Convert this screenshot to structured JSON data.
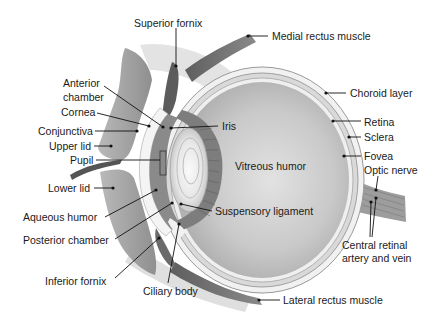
{
  "colors": {
    "background": "#ffffff",
    "text": "#1a1a1a",
    "leader": "#111111",
    "tissue_dark": "#6f6f6f",
    "tissue_mid": "#a9a9a9",
    "tissue_light": "#d6d6d6",
    "vitreous": "#c4c4c4",
    "sclera": "#eeeeee"
  },
  "labels": {
    "superior_fornix": "Superior fornix",
    "medial_rectus": "Medial rectus muscle",
    "anterior_chamber_1": "Anterior",
    "anterior_chamber_2": "chamber",
    "cornea": "Cornea",
    "conjunctiva": "Conjunctiva",
    "upper_lid": "Upper lid",
    "pupil": "Pupil",
    "iris": "Iris",
    "vitreous_humor": "Vitreous humor",
    "choroid_layer": "Choroid layer",
    "retina": "Retina",
    "sclera": "Sclera",
    "fovea": "Fovea",
    "optic_nerve": "Optic nerve",
    "lower_lid": "Lower lid",
    "aqueous_humor": "Aqueous humor",
    "suspensory_ligament": "Suspensory ligament",
    "posterior_chamber": "Posterior chamber",
    "central_retinal_1": "Central retinal",
    "central_retinal_2": "artery and vein",
    "inferior_fornix": "Inferior fornix",
    "ciliary_body": "Ciliary body",
    "lateral_rectus": "Lateral rectus muscle"
  }
}
